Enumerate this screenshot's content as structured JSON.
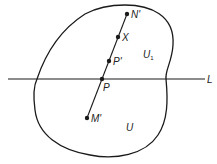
{
  "diagram": {
    "region_labels": {
      "outer": "U",
      "upper": "U",
      "upper_sub": "1"
    },
    "line_label": "L",
    "points": {
      "n_prime": "N'",
      "x": "X",
      "p_prime": "P'",
      "p": "P",
      "m_prime": "M'"
    },
    "colors": {
      "stroke": "#1a1a1a",
      "background": "#ffffff"
    }
  }
}
